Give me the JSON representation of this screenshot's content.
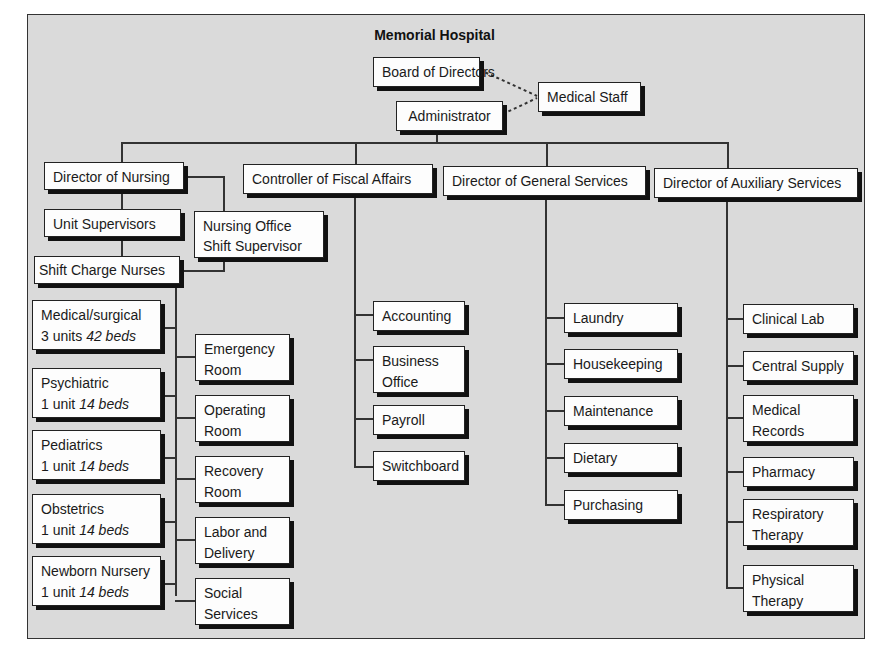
{
  "chart_data": {
    "type": "org-chart",
    "title": "Memorial Hospital",
    "nodes": [
      {
        "id": "board",
        "label": "Board of Directors"
      },
      {
        "id": "admin",
        "label": "Administrator",
        "parent": "board"
      },
      {
        "id": "medstaff",
        "label": "Medical Staff",
        "dotted_to": [
          "board",
          "admin"
        ]
      },
      {
        "id": "dnursing",
        "label": "Director of Nursing",
        "parent": "admin"
      },
      {
        "id": "controller",
        "label": "Controller of Fiscal Affairs",
        "parent": "admin"
      },
      {
        "id": "dgeneral",
        "label": "Director of General Services",
        "parent": "admin"
      },
      {
        "id": "dauxiliary",
        "label": "Director of Auxiliary Services",
        "parent": "admin"
      },
      {
        "id": "unitsup",
        "label": "Unit Supervisors",
        "parent": "dnursing"
      },
      {
        "id": "nursoffice",
        "label": "Nursing Office Shift Supervisor",
        "parent": "dnursing"
      },
      {
        "id": "shiftcharge",
        "label": "Shift Charge Nurses",
        "parent": "unitsup"
      },
      {
        "id": "medsurg",
        "label": "Medical/surgical",
        "units": "3 units",
        "beds": "42 beds",
        "parent": "shiftcharge"
      },
      {
        "id": "psych",
        "label": "Psychiatric",
        "units": "1 unit",
        "beds": "14 beds",
        "parent": "shiftcharge"
      },
      {
        "id": "peds",
        "label": "Pediatrics",
        "units": "1 unit",
        "beds": "14 beds",
        "parent": "shiftcharge"
      },
      {
        "id": "obs",
        "label": "Obstetrics",
        "units": "1 unit",
        "beds": "14 beds",
        "parent": "shiftcharge"
      },
      {
        "id": "newborn",
        "label": "Newborn Nursery",
        "units": "1 unit",
        "beds": "14 beds",
        "parent": "shiftcharge"
      },
      {
        "id": "er",
        "label": "Emergency Room",
        "parent": "shiftcharge"
      },
      {
        "id": "or",
        "label": "Operating Room",
        "parent": "shiftcharge"
      },
      {
        "id": "rr",
        "label": "Recovery Room",
        "parent": "shiftcharge"
      },
      {
        "id": "ld",
        "label": "Labor and Delivery",
        "parent": "shiftcharge"
      },
      {
        "id": "ss",
        "label": "Social Services",
        "parent": "shiftcharge"
      },
      {
        "id": "acct",
        "label": "Accounting",
        "parent": "controller"
      },
      {
        "id": "bo",
        "label": "Business Office",
        "parent": "controller"
      },
      {
        "id": "payroll",
        "label": "Payroll",
        "parent": "controller"
      },
      {
        "id": "switch",
        "label": "Switchboard",
        "parent": "controller"
      },
      {
        "id": "laundry",
        "label": "Laundry",
        "parent": "dgeneral"
      },
      {
        "id": "house",
        "label": "Housekeeping",
        "parent": "dgeneral"
      },
      {
        "id": "maint",
        "label": "Maintenance",
        "parent": "dgeneral"
      },
      {
        "id": "diet",
        "label": "Dietary",
        "parent": "dgeneral"
      },
      {
        "id": "purch",
        "label": "Purchasing",
        "parent": "dgeneral"
      },
      {
        "id": "lab",
        "label": "Clinical Lab",
        "parent": "dauxiliary"
      },
      {
        "id": "supply",
        "label": "Central Supply",
        "parent": "dauxiliary"
      },
      {
        "id": "records",
        "label": "Medical Records",
        "parent": "dauxiliary"
      },
      {
        "id": "pharm",
        "label": "Pharmacy",
        "parent": "dauxiliary"
      },
      {
        "id": "resp",
        "label": "Respiratory Therapy",
        "parent": "dauxiliary"
      },
      {
        "id": "phys",
        "label": "Physical Therapy",
        "parent": "dauxiliary"
      }
    ]
  },
  "title": "Memorial Hospital",
  "top": {
    "board": "Board of Directors",
    "admin": "Administrator",
    "medstaff": "Medical Staff"
  },
  "directors": {
    "nursing": "Director of Nursing",
    "fiscal": "Controller of Fiscal Affairs",
    "general": "Director of General Services",
    "auxiliary": "Director of Auxiliary Services"
  },
  "nursing": {
    "unit_supervisors": "Unit Supervisors",
    "office_l1": "Nursing Office",
    "office_l2": "Shift Supervisor",
    "shift_charge": "Shift Charge Nurses",
    "wards": [
      {
        "name": "Medical/surgical",
        "units": "3 units",
        "beds": "42 beds"
      },
      {
        "name": "Psychiatric",
        "units": "1 unit",
        "beds": "14 beds"
      },
      {
        "name": "Pediatrics",
        "units": "1 unit",
        "beds": "14 beds"
      },
      {
        "name": "Obstetrics",
        "units": "1 unit",
        "beds": "14 beds"
      },
      {
        "name": "Newborn Nursery",
        "units": "1 unit",
        "beds": "14 beds"
      }
    ],
    "services": [
      {
        "l1": "Emergency",
        "l2": "Room"
      },
      {
        "l1": "Operating",
        "l2": "Room"
      },
      {
        "l1": "Recovery",
        "l2": "Room"
      },
      {
        "l1": "Labor and",
        "l2": "Delivery"
      },
      {
        "l1": "Social",
        "l2": "Services"
      }
    ]
  },
  "fiscal": [
    {
      "l1": "Accounting"
    },
    {
      "l1": "Business",
      "l2": "Office"
    },
    {
      "l1": "Payroll"
    },
    {
      "l1": "Switchboard"
    }
  ],
  "general": [
    "Laundry",
    "Housekeeping",
    "Maintenance",
    "Dietary",
    "Purchasing"
  ],
  "auxiliary": [
    {
      "l1": "Clinical Lab"
    },
    {
      "l1": "Central Supply"
    },
    {
      "l1": "Medical",
      "l2": "Records"
    },
    {
      "l1": "Pharmacy"
    },
    {
      "l1": "Respiratory",
      "l2": "Therapy"
    },
    {
      "l1": "Physical",
      "l2": "Therapy"
    }
  ]
}
